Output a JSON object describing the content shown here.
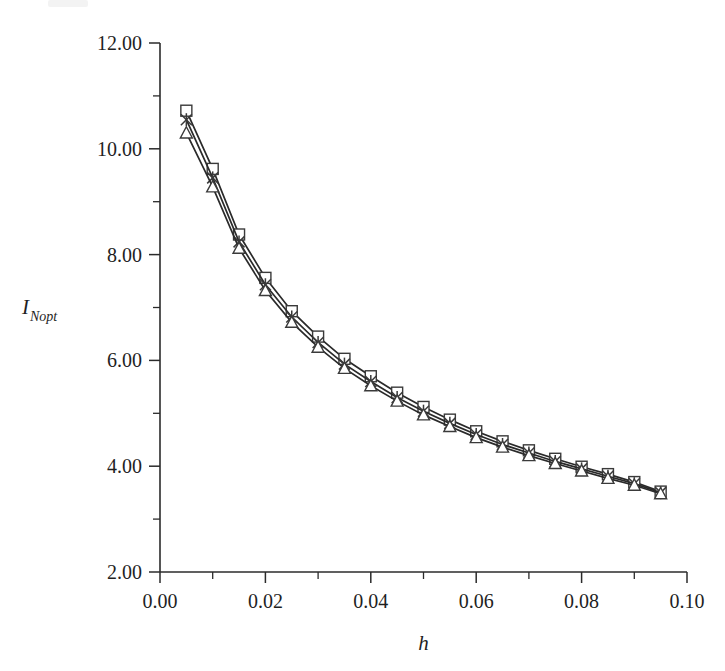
{
  "figure": {
    "background_color": "#ffffff",
    "line_color": "#2a2a2a",
    "axis_color": "#2b2b2b"
  },
  "chart_data": {
    "type": "line",
    "title": "",
    "subtitle": "",
    "xlabel": "h",
    "ylabel": "I_Nopt",
    "ylabel_base": "I",
    "ylabel_sub": "Nopt",
    "xlim": [
      0.0,
      0.1
    ],
    "ylim": [
      2.0,
      12.0
    ],
    "x_major_tick_step": 0.02,
    "x_minor_tick_step": 0.01,
    "y_major_tick_step": 2.0,
    "y_minor_tick_step": 1.0,
    "xticks": [
      0.0,
      0.02,
      0.04,
      0.06,
      0.08,
      0.1
    ],
    "xticklabels": [
      "0.00",
      "0.02",
      "0.04",
      "0.06",
      "0.08",
      "0.10"
    ],
    "yticks": [
      2.0,
      4.0,
      6.0,
      8.0,
      10.0,
      12.0
    ],
    "yticklabels": [
      "2.00",
      "4.00",
      "6.00",
      "8.00",
      "10.00",
      "12.00"
    ],
    "grid": false,
    "legend": "none",
    "x": [
      0.005,
      0.01,
      0.015,
      0.02,
      0.025,
      0.03,
      0.035,
      0.04,
      0.045,
      0.05,
      0.055,
      0.06,
      0.065,
      0.07,
      0.075,
      0.08,
      0.085,
      0.09,
      0.095
    ],
    "series": [
      {
        "name": "series-square",
        "marker": "square",
        "values": [
          10.72,
          9.62,
          8.38,
          7.56,
          6.93,
          6.45,
          6.03,
          5.7,
          5.39,
          5.12,
          4.88,
          4.66,
          4.47,
          4.3,
          4.14,
          3.99,
          3.85,
          3.7,
          3.52
        ]
      },
      {
        "name": "series-cross",
        "marker": "x",
        "values": [
          10.55,
          9.45,
          8.24,
          7.43,
          6.82,
          6.34,
          5.93,
          5.6,
          5.3,
          5.04,
          4.81,
          4.6,
          4.41,
          4.25,
          4.09,
          3.95,
          3.81,
          3.67,
          3.5
        ]
      },
      {
        "name": "series-triangle",
        "marker": "triangle",
        "values": [
          10.3,
          9.28,
          8.12,
          7.32,
          6.72,
          6.25,
          5.85,
          5.52,
          5.23,
          4.97,
          4.75,
          4.54,
          4.36,
          4.2,
          4.05,
          3.91,
          3.77,
          3.64,
          3.48
        ]
      }
    ]
  }
}
